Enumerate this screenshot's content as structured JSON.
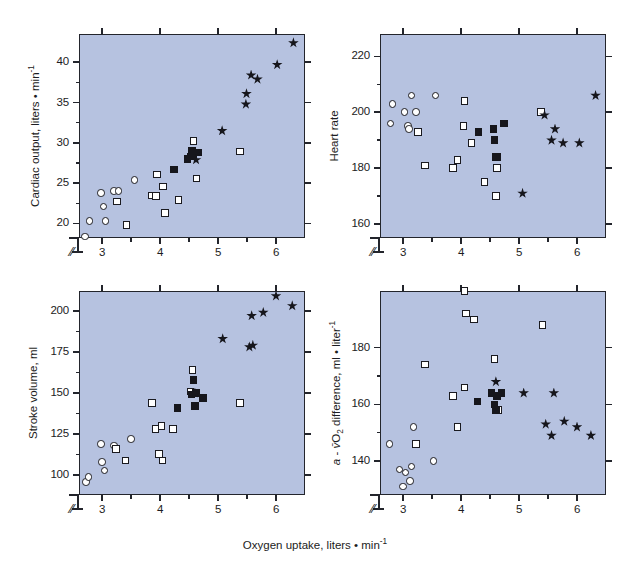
{
  "figure": {
    "background": "#ffffff",
    "plot_background": "#b6c2e0",
    "axis_color": "#23252c",
    "xlabel": "Oxygen uptake, liters • min",
    "xlabel_sup": "-1"
  },
  "chart_data": [
    {
      "id": "cardiac-output",
      "type": "scatter",
      "title": "",
      "ylabel": "Cardiac output, liters • min",
      "ylabel_sup": "-1",
      "xlabel": "",
      "xlim": [
        2.6,
        6.5
      ],
      "ylim": [
        18.2,
        43.5
      ],
      "xticks": [
        3,
        4,
        5,
        6
      ],
      "xminor": [
        3.5,
        4.5,
        5.5
      ],
      "yticks": [
        20,
        25,
        30,
        35,
        40
      ],
      "grid": false,
      "axis_break": true,
      "legend": "none",
      "series": [
        {
          "name": "open-circle",
          "marker": "circle",
          "points": [
            [
              2.78,
              20.3
            ],
            [
              2.98,
              23.8
            ],
            [
              3.02,
              22.1
            ],
            [
              3.06,
              20.3
            ],
            [
              3.2,
              24.0
            ],
            [
              3.28,
              24.0
            ],
            [
              3.56,
              25.4
            ],
            [
              2.7,
              18.4
            ]
          ]
        },
        {
          "name": "open-square",
          "marker": "osquare",
          "points": [
            [
              3.26,
              22.7
            ],
            [
              3.42,
              19.8
            ],
            [
              3.85,
              23.5
            ],
            [
              3.93,
              23.4
            ],
            [
              3.95,
              26.1
            ],
            [
              4.05,
              24.6
            ],
            [
              4.08,
              21.3
            ],
            [
              4.32,
              22.9
            ],
            [
              4.58,
              30.2
            ],
            [
              4.63,
              25.6
            ],
            [
              5.38,
              28.9
            ]
          ]
        },
        {
          "name": "filled-square",
          "marker": "fsquare",
          "points": [
            [
              4.24,
              26.7
            ],
            [
              4.47,
              28.0
            ],
            [
              4.53,
              28.3
            ],
            [
              4.55,
              29.0
            ],
            [
              4.57,
              28.6
            ],
            [
              4.66,
              28.8
            ]
          ]
        },
        {
          "name": "filled-star",
          "marker": "star",
          "points": [
            [
              4.62,
              27.9
            ],
            [
              5.07,
              31.5
            ],
            [
              5.48,
              34.8
            ],
            [
              5.49,
              36.1
            ],
            [
              5.57,
              38.4
            ],
            [
              5.68,
              37.9
            ],
            [
              6.02,
              39.7
            ],
            [
              6.3,
              42.4
            ]
          ]
        }
      ]
    },
    {
      "id": "heart-rate",
      "type": "scatter",
      "title": "",
      "ylabel": "Heart rate",
      "ylabel_sup": "",
      "xlabel": "",
      "xlim": [
        2.6,
        6.5
      ],
      "ylim": [
        155,
        228
      ],
      "xticks": [
        3,
        4,
        5,
        6
      ],
      "xminor": [
        3.5,
        4.5,
        5.5
      ],
      "yticks": [
        160,
        180,
        200,
        220
      ],
      "grid": false,
      "axis_break": true,
      "legend": "none",
      "series": [
        {
          "name": "open-circle",
          "marker": "circle",
          "points": [
            [
              2.78,
              196
            ],
            [
              2.82,
              203
            ],
            [
              3.02,
              200
            ],
            [
              3.08,
              195
            ],
            [
              3.1,
              194
            ],
            [
              3.14,
              206
            ],
            [
              3.22,
              200
            ],
            [
              3.56,
              206
            ]
          ]
        },
        {
          "name": "open-square",
          "marker": "osquare",
          "points": [
            [
              3.26,
              193
            ],
            [
              3.38,
              181
            ],
            [
              3.86,
              180
            ],
            [
              3.94,
              183
            ],
            [
              4.06,
              204
            ],
            [
              4.04,
              195
            ],
            [
              4.18,
              189
            ],
            [
              4.4,
              175
            ],
            [
              4.6,
              170
            ],
            [
              4.62,
              180
            ],
            [
              5.38,
              200
            ]
          ]
        },
        {
          "name": "filled-square",
          "marker": "fsquare",
          "points": [
            [
              4.3,
              193
            ],
            [
              4.56,
              194
            ],
            [
              4.58,
              190
            ],
            [
              4.6,
              184
            ],
            [
              4.62,
              184
            ],
            [
              4.74,
              196
            ]
          ]
        },
        {
          "name": "filled-star",
          "marker": "star",
          "points": [
            [
              5.06,
              171
            ],
            [
              5.44,
              199
            ],
            [
              5.56,
              190
            ],
            [
              5.62,
              194
            ],
            [
              5.76,
              189
            ],
            [
              6.04,
              189
            ],
            [
              6.32,
              206
            ]
          ]
        }
      ]
    },
    {
      "id": "stroke-volume",
      "type": "scatter",
      "title": "",
      "ylabel": "Stroke volume, ml",
      "ylabel_sup": "",
      "xlabel": "",
      "xlim": [
        2.6,
        6.5
      ],
      "ylim": [
        88,
        212
      ],
      "xticks": [
        3,
        4,
        5,
        6
      ],
      "xminor": [
        3.5,
        4.5,
        5.5
      ],
      "yticks": [
        100,
        125,
        150,
        175,
        200
      ],
      "grid": false,
      "axis_break": true,
      "legend": "none",
      "series": [
        {
          "name": "open-circle",
          "marker": "circle",
          "points": [
            [
              2.72,
              96
            ],
            [
              2.76,
              99
            ],
            [
              2.98,
              119
            ],
            [
              3.0,
              108
            ],
            [
              3.04,
              103
            ],
            [
              3.2,
              118
            ],
            [
              3.24,
              116
            ],
            [
              3.5,
              122
            ]
          ]
        },
        {
          "name": "open-square",
          "marker": "osquare",
          "points": [
            [
              3.24,
              116
            ],
            [
              3.4,
              109
            ],
            [
              3.86,
              144
            ],
            [
              3.92,
              128
            ],
            [
              4.02,
              130
            ],
            [
              3.98,
              113
            ],
            [
              4.04,
              109
            ],
            [
              4.22,
              128
            ],
            [
              4.52,
              151
            ],
            [
              4.56,
              164
            ],
            [
              5.38,
              144
            ]
          ]
        },
        {
          "name": "filled-square",
          "marker": "fsquare",
          "points": [
            [
              4.3,
              141
            ],
            [
              4.54,
              149
            ],
            [
              4.58,
              158
            ],
            [
              4.6,
              142
            ],
            [
              4.62,
              150
            ],
            [
              4.74,
              147
            ]
          ]
        },
        {
          "name": "filled-star",
          "marker": "star",
          "points": [
            [
              4.6,
              150
            ],
            [
              5.08,
              183
            ],
            [
              5.54,
              178
            ],
            [
              5.6,
              179
            ],
            [
              5.58,
              197
            ],
            [
              5.78,
              199
            ],
            [
              6.0,
              209
            ],
            [
              6.28,
              203
            ]
          ]
        }
      ]
    },
    {
      "id": "avo2-difference",
      "type": "scatter",
      "title": "",
      "ylabel_a": "a",
      "ylabel_v": "v̄",
      "ylabel": "a - vO2 difference, ml • liter",
      "ylabel_sup": "-1",
      "xlabel": "",
      "xlim": [
        2.6,
        6.5
      ],
      "ylim": [
        128,
        200
      ],
      "xticks": [
        3,
        4,
        5,
        6
      ],
      "xminor": [
        3.5,
        4.5,
        5.5
      ],
      "yticks": [
        140,
        160,
        180
      ],
      "grid": false,
      "axis_break": true,
      "legend": "none",
      "series": [
        {
          "name": "open-circle",
          "marker": "circle",
          "points": [
            [
              2.76,
              146
            ],
            [
              2.94,
              137
            ],
            [
              3.0,
              131
            ],
            [
              3.04,
              136
            ],
            [
              3.12,
              133
            ],
            [
              3.14,
              138
            ],
            [
              3.18,
              152
            ],
            [
              3.52,
              140
            ]
          ]
        },
        {
          "name": "open-square",
          "marker": "osquare",
          "points": [
            [
              3.22,
              146
            ],
            [
              3.38,
              174
            ],
            [
              3.86,
              163
            ],
            [
              3.94,
              152
            ],
            [
              4.06,
              200
            ],
            [
              4.08,
              192
            ],
            [
              4.06,
              166
            ],
            [
              4.22,
              190
            ],
            [
              4.58,
              176
            ],
            [
              4.64,
              158
            ],
            [
              5.4,
              188
            ]
          ]
        },
        {
          "name": "filled-square",
          "marker": "fsquare",
          "points": [
            [
              4.28,
              161
            ],
            [
              4.52,
              164
            ],
            [
              4.58,
              160
            ],
            [
              4.6,
              158
            ],
            [
              4.62,
              163
            ],
            [
              4.7,
              164
            ]
          ]
        },
        {
          "name": "filled-star",
          "marker": "star",
          "points": [
            [
              4.6,
              168
            ],
            [
              5.08,
              164
            ],
            [
              5.46,
              153
            ],
            [
              5.56,
              149
            ],
            [
              5.6,
              164
            ],
            [
              5.78,
              154
            ],
            [
              6.0,
              152
            ],
            [
              6.24,
              149
            ]
          ]
        }
      ]
    }
  ]
}
